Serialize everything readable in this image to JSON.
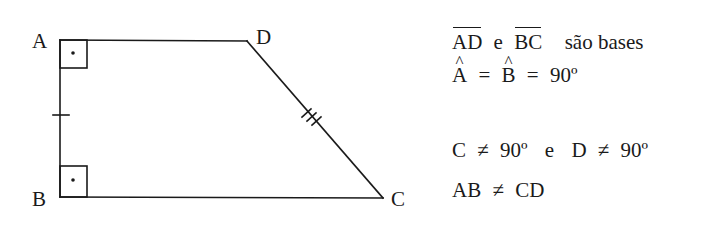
{
  "figure": {
    "shape": "right trapezoid",
    "vertices": {
      "A": {
        "label": "A",
        "x": 60,
        "y": 40
      },
      "D": {
        "label": "D",
        "x": 247,
        "y": 41
      },
      "B": {
        "label": "B",
        "x": 60,
        "y": 197
      },
      "C": {
        "label": "C",
        "x": 383,
        "y": 198
      }
    },
    "right_angle_markers": [
      "A",
      "B"
    ],
    "tick_marks": {
      "AB": 1,
      "DC": 3
    },
    "stroke_color": "#1a1a1a"
  },
  "properties": {
    "line1": {
      "seg1": "AD",
      "conj": "e",
      "seg2": "BC",
      "rest": "são bases"
    },
    "line2": {
      "angle1": "A",
      "eq1": "=",
      "angle2": "B",
      "eq2": "=",
      "value": "90º"
    },
    "line3": {
      "a": "C",
      "neq1": "≠",
      "v1": "90º",
      "conj": "e",
      "b": "D",
      "neq2": "≠",
      "v2": "90º"
    },
    "line4": {
      "a": "AB",
      "neq": "≠",
      "b": "CD"
    }
  }
}
